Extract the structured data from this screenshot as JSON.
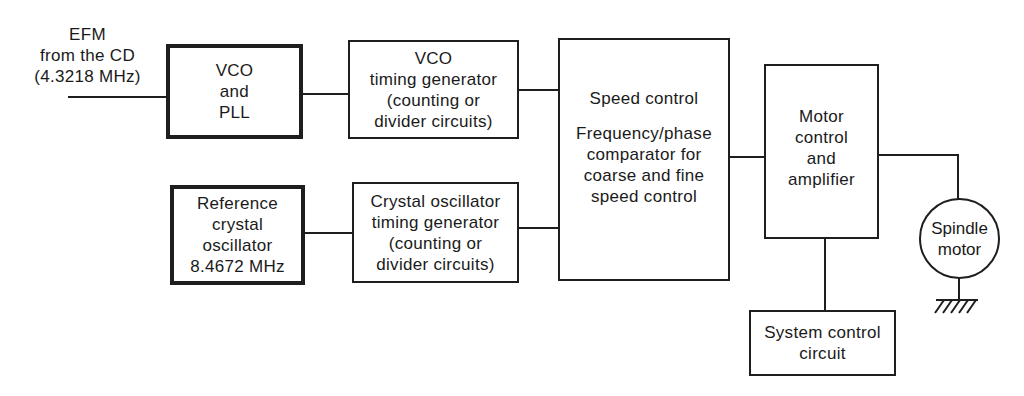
{
  "diagram": {
    "type": "block-diagram",
    "input_label": [
      "EFM",
      "from the CD",
      "(4.3218 MHz)"
    ],
    "blocks": {
      "vco_pll": {
        "lines": [
          "VCO",
          "and",
          "PLL"
        ],
        "emphasis": "thick-border"
      },
      "vco_timing": {
        "lines": [
          "VCO",
          "timing generator",
          "(counting or",
          "divider circuits)"
        ]
      },
      "ref_crystal": {
        "lines": [
          "Reference",
          "crystal",
          "oscillator",
          "8.4672 MHz"
        ],
        "emphasis": "thick-border"
      },
      "crystal_timing": {
        "lines": [
          "Crystal oscillator",
          "timing generator",
          "(counting or",
          "divider circuits)"
        ]
      },
      "speed_control": {
        "title": "Speed control",
        "lines": [
          "Frequency/phase",
          "comparator for",
          "coarse and fine",
          "speed control"
        ]
      },
      "motor_control": {
        "lines": [
          "Motor",
          "control",
          "and",
          "amplifier"
        ]
      },
      "system_control": {
        "lines": [
          "System control",
          "circuit"
        ]
      },
      "spindle_motor": {
        "lines": [
          "Spindle",
          "motor"
        ],
        "shape": "circle"
      }
    },
    "connections": [
      [
        "EFM input",
        "VCO and PLL"
      ],
      [
        "VCO and PLL",
        "VCO timing generator"
      ],
      [
        "VCO timing generator",
        "Speed control"
      ],
      [
        "Reference crystal oscillator",
        "Crystal oscillator timing generator"
      ],
      [
        "Crystal oscillator timing generator",
        "Speed control"
      ],
      [
        "Speed control",
        "Motor control and amplifier"
      ],
      [
        "Motor control and amplifier",
        "Spindle motor"
      ],
      [
        "Motor control and amplifier",
        "System control circuit"
      ],
      [
        "Spindle motor",
        "Ground"
      ]
    ],
    "colors": {
      "stroke": "#1e1e1e",
      "background": "#ffffff"
    }
  }
}
